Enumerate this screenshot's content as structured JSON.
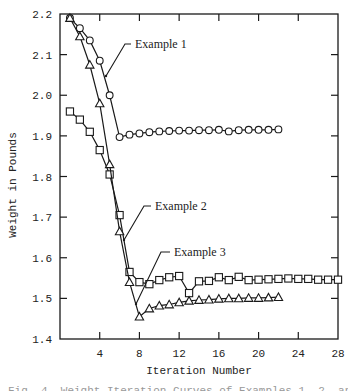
{
  "chart_data": {
    "type": "line",
    "title": "",
    "xlabel": "Iteration Number",
    "ylabel": "Weight in Pounds",
    "xlim": [
      0,
      28
    ],
    "ylim": [
      1.4,
      2.2
    ],
    "xticks": [
      4,
      8,
      12,
      16,
      20,
      24,
      28
    ],
    "yticks": [
      1.4,
      1.5,
      1.6,
      1.7,
      1.8,
      1.9,
      2.0,
      2.1,
      2.2
    ],
    "ytick_labels": [
      "1.4",
      "1.5",
      "1.6",
      "1.7",
      "1.8",
      "1.9",
      "2.0",
      "2.1",
      "2.2"
    ],
    "grid": false,
    "legend": "inline annotations with leader lines",
    "series": [
      {
        "name": "Example 1",
        "marker": "circle",
        "x": [
          1,
          2,
          3,
          4,
          5,
          6,
          7,
          8,
          9,
          10,
          11,
          12,
          13,
          14,
          15,
          16,
          17,
          18,
          19,
          20,
          21,
          22
        ],
        "values": [
          2.19,
          2.165,
          2.135,
          2.085,
          2.0,
          1.897,
          1.903,
          1.906,
          1.909,
          1.911,
          1.912,
          1.913,
          1.913,
          1.914,
          1.914,
          1.915,
          1.911,
          1.914,
          1.915,
          1.915,
          1.915,
          1.916
        ]
      },
      {
        "name": "Example 2",
        "marker": "square",
        "x": [
          1,
          2,
          3,
          4,
          5,
          6,
          7,
          8,
          9,
          10,
          11,
          12,
          13,
          14,
          15,
          16,
          17,
          18,
          19,
          20,
          21,
          22,
          23,
          24,
          25,
          26,
          27,
          28
        ],
        "values": [
          1.96,
          1.94,
          1.91,
          1.865,
          1.805,
          1.705,
          1.565,
          1.54,
          1.535,
          1.545,
          1.552,
          1.555,
          1.513,
          1.542,
          1.543,
          1.552,
          1.545,
          1.553,
          1.545,
          1.546,
          1.547,
          1.548,
          1.549,
          1.548,
          1.548,
          1.546,
          1.546,
          1.546
        ]
      },
      {
        "name": "Example 3",
        "marker": "triangle",
        "x": [
          1,
          2,
          3,
          4,
          5,
          6,
          7,
          8,
          9,
          10,
          11,
          12,
          13,
          14,
          15,
          16,
          17,
          18,
          19,
          20,
          21,
          22
        ],
        "values": [
          2.19,
          2.145,
          2.075,
          1.98,
          1.83,
          1.665,
          1.54,
          1.455,
          1.475,
          1.482,
          1.485,
          1.49,
          1.494,
          1.496,
          1.497,
          1.499,
          1.5,
          1.5,
          1.501,
          1.501,
          1.502,
          1.503
        ]
      }
    ],
    "annotations": [
      {
        "text": "Example 1",
        "label_x": 135,
        "label_y": 48,
        "leader": [
          [
            131,
            44
          ],
          [
            125,
            44
          ],
          [
            106,
            76
          ]
        ]
      },
      {
        "text": "Example 2",
        "label_x": 155,
        "label_y": 210,
        "leader": [
          [
            151,
            206
          ],
          [
            144,
            206
          ],
          [
            124,
            240
          ]
        ]
      },
      {
        "text": "Example 3",
        "label_x": 174,
        "label_y": 256,
        "leader": [
          [
            170,
            252
          ],
          [
            161,
            252
          ],
          [
            136,
            304
          ]
        ]
      }
    ]
  },
  "caption": "Fig. 4. Weight Iteration Curves of Examples 1, 2, and 3"
}
